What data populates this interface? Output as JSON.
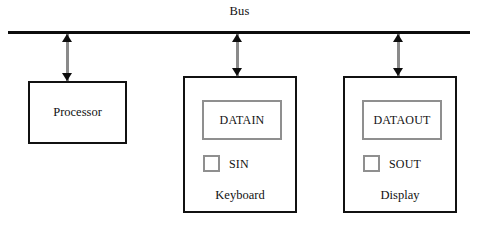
{
  "diagram": {
    "bus": {
      "label": "Bus"
    },
    "connectors": [
      {
        "name": "processor-bus-link"
      },
      {
        "name": "keyboard-bus-link"
      },
      {
        "name": "display-bus-link"
      }
    ],
    "units": [
      {
        "id": "processor",
        "center_label": "Processor"
      },
      {
        "id": "keyboard",
        "caption": "Keyboard",
        "register": "DATAIN",
        "flag": "SIN"
      },
      {
        "id": "display",
        "caption": "Display",
        "register": "DATAOUT",
        "flag": "SOUT"
      }
    ]
  }
}
